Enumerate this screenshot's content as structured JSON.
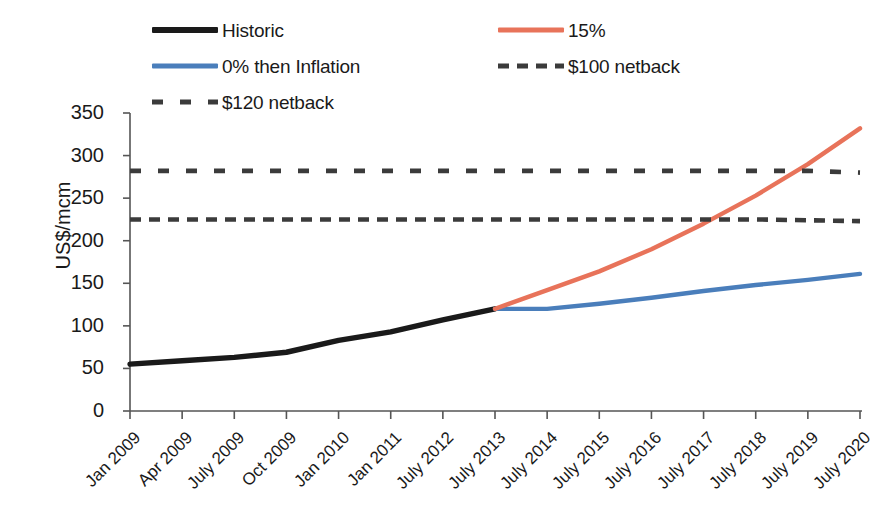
{
  "legend": {
    "items": [
      {
        "label": "Historic",
        "style": "solid",
        "color": "#1a1a1a",
        "name": "legend-item-historic"
      },
      {
        "label": "0% then Inflation",
        "style": "solid",
        "color": "#4a7ebb",
        "name": "legend-item-inflation"
      },
      {
        "label": "$120 netback",
        "style": "dashed-wide",
        "color": "#3b3b3b",
        "name": "legend-item-netback-120"
      },
      {
        "label": "15%",
        "style": "solid",
        "color": "#e8735a",
        "name": "legend-item-15-percent"
      },
      {
        "label": "$100 netback",
        "style": "dashed",
        "color": "#3b3b3b",
        "name": "legend-item-netback-100"
      }
    ]
  },
  "axis": {
    "ylabel": "US$/mcm",
    "yticks": [
      "0",
      "50",
      "100",
      "150",
      "200",
      "250",
      "300",
      "350"
    ],
    "xticks": [
      "Jan 2009",
      "Apr 2009",
      "July 2009",
      "Oct 2009",
      "Jan 2010",
      "Jan 2011",
      "July 2012",
      "July 2013",
      "July 2014",
      "July 2015",
      "July 2016",
      "July 2017",
      "July 2018",
      "July 2019",
      "July 2020"
    ]
  },
  "colors": {
    "historic": "#1a1a1a",
    "inflation": "#4a7ebb",
    "growth15": "#e8735a",
    "netback": "#3b3b3b",
    "axis": "#555555",
    "background": "#ffffff"
  },
  "chart_data": {
    "type": "line",
    "title": "",
    "xlabel": "",
    "ylabel": "US$/mcm",
    "ylim": [
      0,
      350
    ],
    "ytick_step": 50,
    "grid": false,
    "legend_position": "top",
    "categories": [
      "Jan 2009",
      "Apr 2009",
      "July 2009",
      "Oct 2009",
      "Jan 2010",
      "Jan 2011",
      "July 2012",
      "July 2013",
      "July 2014",
      "July 2015",
      "July 2016",
      "July 2017",
      "July 2018",
      "July 2019",
      "July 2020"
    ],
    "series": [
      {
        "name": "Historic",
        "color": "#1a1a1a",
        "style": "solid",
        "values": [
          55,
          59,
          63,
          69,
          83,
          93,
          107,
          120,
          null,
          null,
          null,
          null,
          null,
          null,
          null
        ]
      },
      {
        "name": "0% then Inflation",
        "color": "#4a7ebb",
        "style": "solid",
        "values": [
          null,
          null,
          null,
          null,
          null,
          null,
          null,
          120,
          120,
          126,
          133,
          141,
          148,
          154,
          161
        ]
      },
      {
        "name": "15%",
        "color": "#e8735a",
        "style": "solid",
        "values": [
          null,
          null,
          null,
          null,
          null,
          null,
          null,
          120,
          142,
          164,
          190,
          220,
          253,
          290,
          332
        ]
      },
      {
        "name": "$120 netback",
        "color": "#3b3b3b",
        "style": "dashed-wide",
        "constant": 282,
        "values": [
          282,
          282,
          282,
          282,
          282,
          282,
          282,
          282,
          282,
          282,
          282,
          282,
          282,
          282,
          280
        ]
      },
      {
        "name": "$100 netback",
        "color": "#3b3b3b",
        "style": "dashed",
        "constant": 225,
        "values": [
          225,
          225,
          225,
          225,
          225,
          225,
          225,
          225,
          225,
          225,
          225,
          225,
          225,
          224,
          223
        ]
      }
    ],
    "annotations": [
      "Historic line ends and forecast scenarios begin at July 2013 (120 US$/mcm)",
      "15% series crosses $100 netback between July 2017 and July 2018",
      "15% series crosses $120 netback just before July 2019"
    ]
  }
}
